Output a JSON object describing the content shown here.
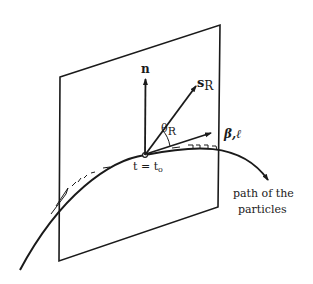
{
  "figure": {
    "labels": {
      "normal": "n",
      "s_main": "s",
      "s_sub": "R",
      "theta_main": "θ",
      "theta_sub": "R",
      "beta_l": "β,ℓ",
      "time": "t = t",
      "time_sub": "o",
      "path_line1": "path of the",
      "path_line2": "particles"
    },
    "colors": {
      "ink": "#1a1a1a",
      "background": "#ffffff"
    }
  }
}
